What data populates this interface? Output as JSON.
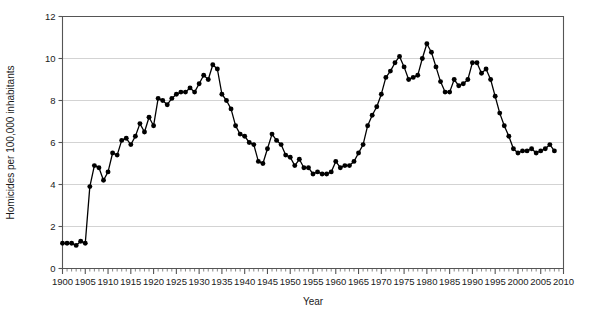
{
  "chart_data": {
    "type": "line",
    "title": "",
    "subtitle": "",
    "xlabel": "Year",
    "ylabel": "Homicides per 100,000 inhabitants",
    "xlim": [
      1900,
      2010
    ],
    "ylim": [
      0,
      12
    ],
    "x_major_ticks": [
      1900,
      1905,
      1910,
      1915,
      1920,
      1925,
      1930,
      1935,
      1940,
      1945,
      1950,
      1955,
      1960,
      1965,
      1970,
      1975,
      1980,
      1985,
      1990,
      1995,
      2000,
      2005,
      2010
    ],
    "x_tick_labels": [
      "1900",
      "1905",
      "1910",
      "1915",
      "1920",
      "1925",
      "1930",
      "1935",
      "1940",
      "1945",
      "1950",
      "1955",
      "1960",
      "1965",
      "1970",
      "1975",
      "1980",
      "1985",
      "1990",
      "1995",
      "2000",
      "2005",
      "2010"
    ],
    "x_minor_tick_step": 1,
    "y_major_ticks": [
      0,
      2,
      4,
      6,
      8,
      10,
      12
    ],
    "y_tick_labels": [
      "0",
      "2",
      "4",
      "6",
      "8",
      "10",
      "12"
    ],
    "grid": "horizontal",
    "legend": "none",
    "marker": "filled-circle",
    "line_color": "#000000",
    "marker_color": "#000000",
    "grid_color": "#c8c8c8",
    "axis_color": "#555555",
    "series": [
      {
        "name": "Homicide rate",
        "x": [
          1900,
          1901,
          1902,
          1903,
          1904,
          1905,
          1906,
          1907,
          1908,
          1909,
          1910,
          1911,
          1912,
          1913,
          1914,
          1915,
          1916,
          1917,
          1918,
          1919,
          1920,
          1921,
          1922,
          1923,
          1924,
          1925,
          1926,
          1927,
          1928,
          1929,
          1930,
          1931,
          1932,
          1933,
          1934,
          1935,
          1936,
          1937,
          1938,
          1939,
          1940,
          1941,
          1942,
          1943,
          1944,
          1945,
          1946,
          1947,
          1948,
          1949,
          1950,
          1951,
          1952,
          1953,
          1954,
          1955,
          1956,
          1957,
          1958,
          1959,
          1960,
          1961,
          1962,
          1963,
          1964,
          1965,
          1966,
          1967,
          1968,
          1969,
          1970,
          1971,
          1972,
          1973,
          1974,
          1975,
          1976,
          1977,
          1978,
          1979,
          1980,
          1981,
          1982,
          1983,
          1984,
          1985,
          1986,
          1987,
          1988,
          1989,
          1990,
          1991,
          1992,
          1993,
          1994,
          1995,
          1996,
          1997,
          1998,
          1999,
          2000,
          2001,
          2002,
          2003,
          2004,
          2005,
          2006,
          2007,
          2008
        ],
        "y": [
          1.2,
          1.2,
          1.2,
          1.1,
          1.3,
          1.2,
          3.9,
          4.9,
          4.8,
          4.2,
          4.6,
          5.5,
          5.4,
          6.1,
          6.2,
          5.9,
          6.3,
          6.9,
          6.5,
          7.2,
          6.8,
          8.1,
          8.0,
          7.8,
          8.1,
          8.3,
          8.4,
          8.4,
          8.6,
          8.4,
          8.8,
          9.2,
          9.0,
          9.7,
          9.5,
          8.3,
          8.0,
          7.6,
          6.8,
          6.4,
          6.3,
          6.0,
          5.9,
          5.1,
          5.0,
          5.7,
          6.4,
          6.1,
          5.9,
          5.4,
          5.3,
          4.9,
          5.2,
          4.8,
          4.8,
          4.5,
          4.6,
          4.5,
          4.5,
          4.6,
          5.1,
          4.8,
          4.9,
          4.9,
          5.1,
          5.5,
          5.9,
          6.8,
          7.3,
          7.7,
          8.3,
          9.1,
          9.4,
          9.8,
          10.1,
          9.6,
          9.0,
          9.1,
          9.2,
          10.0,
          10.7,
          10.3,
          9.6,
          8.9,
          8.4,
          8.4,
          9.0,
          8.7,
          8.8,
          9.0,
          9.8,
          9.8,
          9.3,
          9.5,
          9.0,
          8.2,
          7.4,
          6.8,
          6.3,
          5.7,
          5.5,
          5.6,
          5.6,
          5.7,
          5.5,
          5.6,
          5.7,
          5.9,
          5.6
        ]
      }
    ]
  },
  "axes": {
    "x_title": "Year",
    "y_title": "Homicides per 100,000 inhabitants"
  }
}
